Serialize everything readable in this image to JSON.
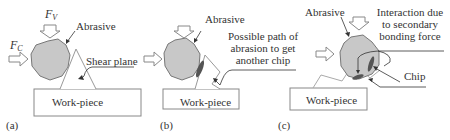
{
  "panels": [
    {
      "id": "a",
      "caption": "(a)",
      "labels": {
        "force_vertical": "F",
        "force_vertical_sub": "V",
        "force_cutting": "F",
        "force_cutting_sub": "C",
        "abrasive": "Abrasive",
        "shear_plane": "Shear plane",
        "workpiece": "Work-piece"
      }
    },
    {
      "id": "b",
      "caption": "(b)",
      "labels": {
        "abrasive": "Abrasive",
        "path_line1": "Possible path of",
        "path_line2": "abrasion to get",
        "path_line3": "another chip",
        "workpiece": "Work-piece"
      }
    },
    {
      "id": "c",
      "caption": "(c)",
      "labels": {
        "abrasive": "Abrasive",
        "interaction_line1": "Interaction due",
        "interaction_line2": "to secondary",
        "interaction_line3": "bonding force",
        "chip": "Chip",
        "workpiece": "Work-piece"
      }
    }
  ],
  "colors": {
    "abrasive_fill": "#c8c8c8",
    "chip_fill": "#555555",
    "outline": "#777777",
    "workpiece_outline": "#888888"
  }
}
